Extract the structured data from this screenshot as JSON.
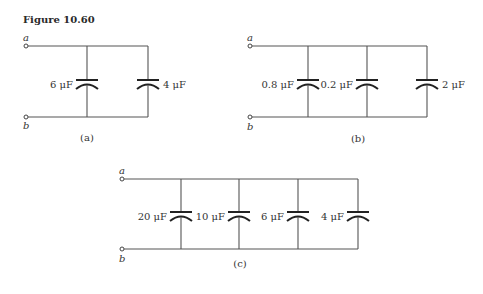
{
  "figure": {
    "title": "Figure 10.60"
  },
  "circuits": [
    {
      "id": "a",
      "caption": "(a)",
      "terminals": {
        "top": "a",
        "bottom": "b"
      },
      "capacitors": [
        {
          "value": "6 μF",
          "label_side": "left"
        },
        {
          "value": "4 μF",
          "label_side": "right"
        }
      ]
    },
    {
      "id": "b",
      "caption": "(b)",
      "terminals": {
        "top": "a",
        "bottom": "b"
      },
      "capacitors": [
        {
          "value": "0.8 μF",
          "label_side": "left"
        },
        {
          "value": "0.2 μF",
          "label_side": "left"
        },
        {
          "value": "2 μF",
          "label_side": "right"
        }
      ]
    },
    {
      "id": "c",
      "caption": "(c)",
      "terminals": {
        "top": "a",
        "bottom": "b"
      },
      "capacitors": [
        {
          "value": "20 μF",
          "label_side": "left"
        },
        {
          "value": "10 μF",
          "label_side": "left"
        },
        {
          "value": "6 μF",
          "label_side": "left"
        },
        {
          "value": "4 μF",
          "label_side": "left"
        }
      ]
    }
  ],
  "colors": {
    "wire": "#555555",
    "plate": "#222222",
    "text": "#333333"
  }
}
